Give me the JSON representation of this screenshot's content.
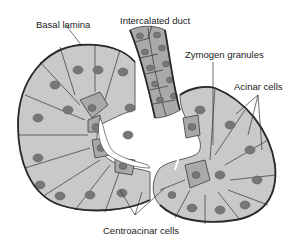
{
  "diagram": {
    "labels": {
      "basal_lamina": "Basal lamina",
      "intercalated_duct": "Intercalated duct",
      "zymogen_granules": "Zymogen granules",
      "acinar_cells": "Acinar cells",
      "centroacinar_cells": "Centroacinar cells"
    },
    "colors": {
      "cell_fill": "#c9c9c9",
      "dark_cell_fill": "#a9a9a9",
      "nucleus": "#777777",
      "outline": "#2a2a2a",
      "lumen": "#ffffff"
    }
  }
}
